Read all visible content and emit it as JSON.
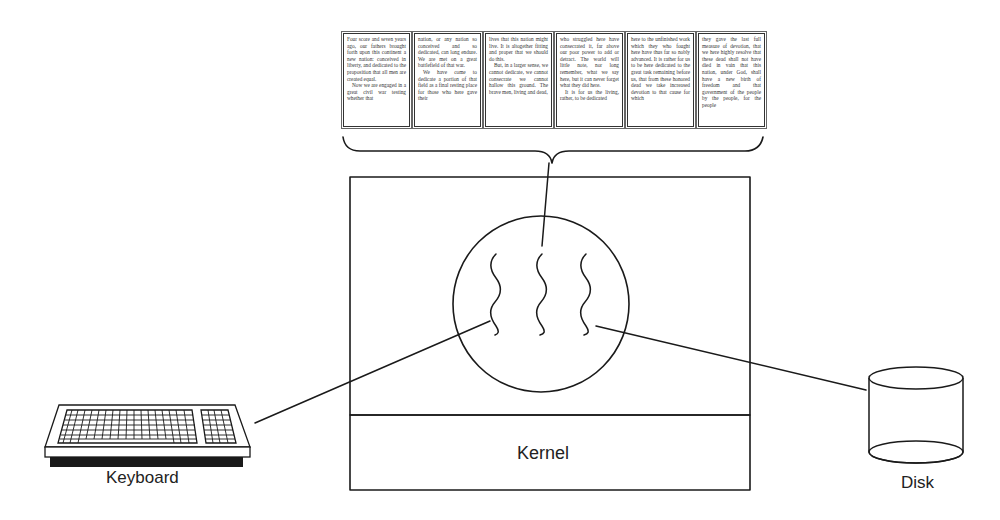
{
  "diagram": {
    "pages": [
      {
        "paragraphs": [
          {
            "indent": false,
            "text": "Four score and seven years ago, our fathers brought forth upon this continent a new nation: conceived in liberty, and dedicated to the proposition that all men are created equal."
          },
          {
            "indent": true,
            "text": "Now we are engaged in a great civil war testing whether that"
          }
        ]
      },
      {
        "paragraphs": [
          {
            "indent": false,
            "text": "nation, or any nation so conceived and so dedicated, can long endure. We are met on a great battlefield of that war."
          },
          {
            "indent": true,
            "text": "We have come to dedicate a portion of that field as a final resting place for those who here gave their"
          }
        ]
      },
      {
        "paragraphs": [
          {
            "indent": false,
            "text": "lives that this nation might live. It is altogether fitting and proper that we should do this."
          },
          {
            "indent": true,
            "text": "But, in a larger sense, we cannot dedicate, we cannot consecrate we cannot hallow this ground. The brave men, living and dead,"
          }
        ]
      },
      {
        "paragraphs": [
          {
            "indent": false,
            "text": "who struggled here have consecrated it, far above our poor power to add or detract. The world will little note, nor long remember, what we say here, but it can never forget what they did here."
          },
          {
            "indent": true,
            "text": "It is for us the living, rather, to be dedicated"
          }
        ]
      },
      {
        "paragraphs": [
          {
            "indent": false,
            "text": "here to the unfinished work which they who fought here have thus far so nobly advanced. It is rather for us to be here dedicated to the great task remaining before us, that from these honored dead we take increased devotion to that cause for which"
          }
        ]
      },
      {
        "paragraphs": [
          {
            "indent": false,
            "text": "they gave the last full measure of devotion, that we here highly resolve that these dead shall not have died in vain that this nation, under God, shall have a new birth of freedom and that government of the people by the people, for the people"
          }
        ]
      }
    ],
    "labels": {
      "keyboard": "Keyboard",
      "disk": "Disk",
      "kernel": "Kernel"
    },
    "icons": {
      "keyboard": "keyboard-icon",
      "disk": "disk-cylinder-icon",
      "threads": "thread-squiggle-icon",
      "brace": "curly-brace"
    },
    "colors": {
      "stroke": "#1a1a1a",
      "text": "#222222",
      "background": "#ffffff"
    }
  }
}
